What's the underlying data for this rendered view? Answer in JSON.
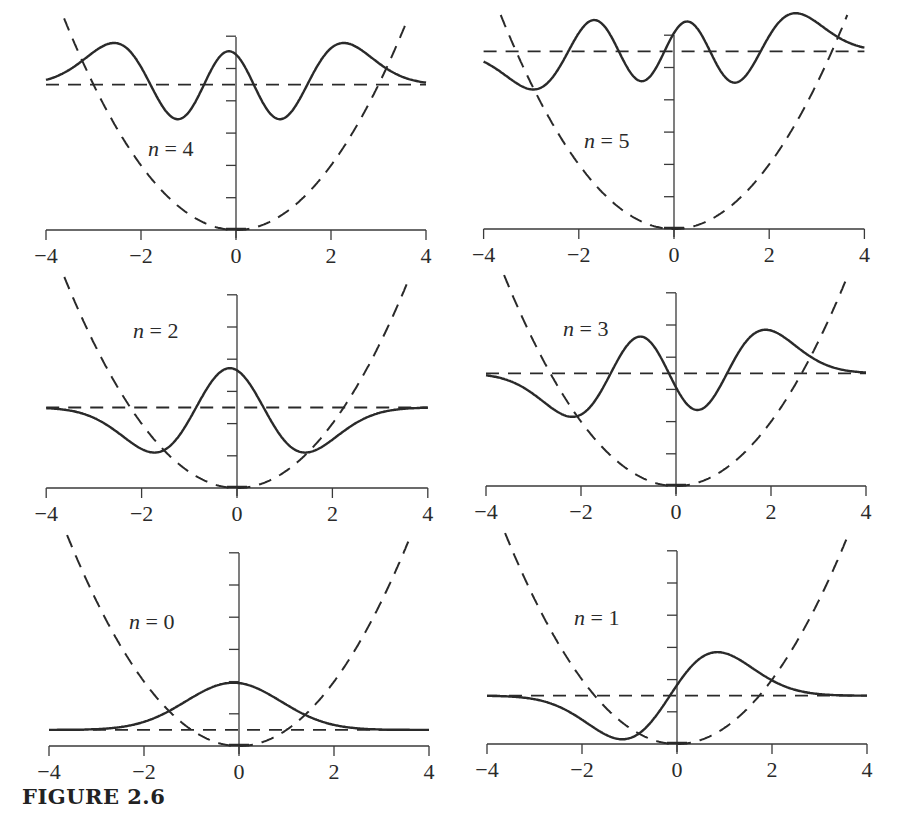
{
  "caption": "FIGURE 2.6",
  "chart_data": [
    {
      "type": "line",
      "title": "n = 4",
      "panel": "top-left",
      "n": 4,
      "xlabel": "",
      "ylabel": "",
      "xlim": [
        -4,
        4
      ],
      "x_ticks": [
        "-4",
        "-2",
        "0",
        "2",
        "4"
      ],
      "y_ticks": [
        0,
        1,
        2,
        3,
        4,
        5,
        6
      ],
      "energy_level": 4.5,
      "series": [
        {
          "name": "potential V(x) = x^2/2",
          "style": "dashed",
          "description": "parabola"
        },
        {
          "name": "energy level E_4",
          "style": "dashed",
          "value": 4.5
        },
        {
          "name": "wavefunction psi_4 (offset by E_4)",
          "style": "solid",
          "peaks_x": [
            -2.6,
            -0.1,
            2.3
          ],
          "troughs_x": [
            -1.2,
            1.0
          ]
        }
      ]
    },
    {
      "type": "line",
      "title": "n = 5",
      "panel": "top-right",
      "n": 5,
      "xlim": [
        -4,
        4
      ],
      "x_ticks": [
        "-4",
        "-2",
        "0",
        "2",
        "4"
      ],
      "y_ticks": [
        0,
        1,
        2,
        3,
        4,
        5,
        6
      ],
      "energy_level": 5.5,
      "series": [
        {
          "name": "potential V(x) = x^2/2",
          "style": "dashed"
        },
        {
          "name": "energy level E_5",
          "style": "dashed",
          "value": 5.5
        },
        {
          "name": "wavefunction psi_5 (offset by E_5)",
          "style": "solid",
          "peaks_x": [
            -1.6,
            0.3,
            2.6
          ],
          "troughs_x": [
            -2.9,
            -0.6,
            1.4
          ]
        }
      ]
    },
    {
      "type": "line",
      "title": "n = 2",
      "panel": "middle-left",
      "n": 2,
      "xlim": [
        -4,
        4
      ],
      "x_ticks": [
        "-4",
        "-2",
        "0",
        "2",
        "4"
      ],
      "y_ticks": [
        0,
        1,
        2,
        3,
        4,
        5,
        6
      ],
      "energy_level": 2.5,
      "series": [
        {
          "name": "potential V(x) = x^2/2",
          "style": "dashed"
        },
        {
          "name": "energy level E_2",
          "style": "dashed",
          "value": 2.5
        },
        {
          "name": "wavefunction psi_2 (offset by E_2)",
          "style": "solid",
          "peaks_x": [
            -1.7,
            1.4
          ],
          "troughs_x": [
            -0.1
          ]
        }
      ]
    },
    {
      "type": "line",
      "title": "n = 3",
      "panel": "middle-right",
      "n": 3,
      "xlim": [
        -4,
        4
      ],
      "x_ticks": [
        "-4",
        "-2",
        "0",
        "2",
        "4"
      ],
      "y_ticks": [
        0,
        1,
        2,
        3,
        4,
        5,
        6
      ],
      "energy_level": 3.5,
      "series": [
        {
          "name": "potential V(x) = x^2/2",
          "style": "dashed"
        },
        {
          "name": "energy level E_3",
          "style": "dashed",
          "value": 3.5
        },
        {
          "name": "wavefunction psi_3 (offset by E_3)",
          "style": "solid",
          "peaks_x": [
            -0.8,
            1.9
          ],
          "troughs_x": [
            -2.1,
            0.5
          ]
        }
      ]
    },
    {
      "type": "line",
      "title": "n = 0",
      "panel": "bottom-left",
      "n": 0,
      "xlim": [
        -4,
        4
      ],
      "x_ticks": [
        "-4",
        "-2",
        "0",
        "2",
        "4"
      ],
      "y_ticks": [
        0,
        1,
        2,
        3,
        4,
        5,
        6
      ],
      "energy_level": 0.5,
      "series": [
        {
          "name": "potential V(x) = x^2/2",
          "style": "dashed"
        },
        {
          "name": "energy level E_0",
          "style": "dashed",
          "value": 0.5
        },
        {
          "name": "wavefunction psi_0 (offset by E_0)",
          "style": "solid",
          "peaks_x": [
            -0.1
          ],
          "troughs_x": []
        }
      ]
    },
    {
      "type": "line",
      "title": "n = 1",
      "panel": "bottom-right",
      "n": 1,
      "xlim": [
        -4,
        4
      ],
      "x_ticks": [
        "-4",
        "-2",
        "0",
        "2",
        "4"
      ],
      "y_ticks": [
        0,
        1,
        2,
        3,
        4,
        5,
        6
      ],
      "energy_level": 1.5,
      "series": [
        {
          "name": "potential V(x) = x^2/2",
          "style": "dashed"
        },
        {
          "name": "energy level E_1",
          "style": "dashed",
          "value": 1.5
        },
        {
          "name": "wavefunction psi_1 (offset by E_1)",
          "style": "solid",
          "peaks_x": [
            0.9
          ],
          "troughs_x": [
            -1.1
          ]
        }
      ]
    }
  ],
  "panels": [
    {
      "n": 4,
      "label_prefix": "n",
      "label_eq": " = ",
      "label_num": "4",
      "ox": 236,
      "oy": 230,
      "sx": 47.5,
      "sy": 32.3,
      "ytop": 37,
      "sign": 1,
      "amp": 2.25,
      "shift": -0.15,
      "lx": 148,
      "ly": 156
    },
    {
      "n": 5,
      "label_prefix": "n",
      "label_eq": " = ",
      "label_num": "5",
      "ox": 674,
      "oy": 229,
      "sx": 47.6,
      "sy": 32.3,
      "ytop": 35,
      "sign": 1,
      "amp": 2.1,
      "shift": -0.2,
      "lx": 584,
      "ly": 148
    },
    {
      "n": 2,
      "label_prefix": "n",
      "label_eq": " = ",
      "label_num": "2",
      "ox": 237,
      "oy": 488,
      "sx": 47.7,
      "sy": 32.2,
      "ytop": 295,
      "sign": -1,
      "amp": 2.3,
      "shift": -0.15,
      "lx": 133,
      "ly": 338
    },
    {
      "n": 3,
      "label_prefix": "n",
      "label_eq": " = ",
      "label_num": "3",
      "ox": 676,
      "oy": 486,
      "sx": 47.5,
      "sy": 32.2,
      "ytop": 293,
      "sign": 1,
      "amp": 2.3,
      "shift": -0.15,
      "lx": 563,
      "ly": 336
    },
    {
      "n": 0,
      "label_prefix": "n",
      "label_eq": " = ",
      "label_num": "0",
      "ox": 239,
      "oy": 746,
      "sx": 47.5,
      "sy": 32.2,
      "ytop": 553,
      "sign": 1,
      "amp": 1.95,
      "shift": -0.12,
      "lx": 129,
      "ly": 629
    },
    {
      "n": 1,
      "label_prefix": "n",
      "label_eq": " = ",
      "label_num": "1",
      "ox": 677,
      "oy": 744,
      "sx": 47.5,
      "sy": 32.2,
      "ytop": 551,
      "sign": 1,
      "amp": 2.1,
      "shift": -0.15,
      "lx": 574,
      "ly": 625
    }
  ],
  "style": {
    "ink": "#2a2a2a",
    "axis": "#3a3a3a",
    "background": "#ffffff"
  }
}
